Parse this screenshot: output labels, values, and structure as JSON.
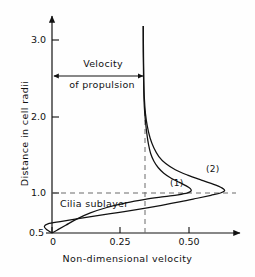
{
  "chart_data": {
    "type": "line",
    "title": "",
    "xlabel": "Non-dimensional velocity",
    "ylabel": "Distance in cell radii",
    "xlim": [
      0,
      0.72
    ],
    "ylim": [
      0.5,
      3.2
    ],
    "xticks": [
      0,
      0.25,
      0.5
    ],
    "xtick_labels": [
      "0",
      "0.25",
      "0.50"
    ],
    "yticks": [
      0.5,
      1.0,
      2.0,
      3.0
    ],
    "ytick_labels": [
      "0.5",
      "1.0",
      "2.0",
      "3.0"
    ],
    "grid": false,
    "legend_position": "inline-annotation",
    "reference_lines": [
      {
        "name": "propulsion-velocity-line",
        "orientation": "vertical",
        "value": 0.33,
        "style": "dashed"
      },
      {
        "name": "cell-radius-line",
        "orientation": "horizontal",
        "value": 1.0,
        "style": "dashed"
      }
    ],
    "annotations": [
      {
        "name": "velocity-of-propulsion",
        "text_line1": "Velocity",
        "text_line2": "of propulsion",
        "arrow": "double-headed",
        "from_x": 0.0,
        "to_x": 0.33,
        "y": 2.62
      },
      {
        "name": "cilia-sublayer",
        "text": "Cilia sublayer",
        "x": 0.04,
        "y": 0.92
      },
      {
        "name": "curve-1-label",
        "text": "(1)",
        "x": 0.41,
        "y": 1.12
      },
      {
        "name": "curve-2-label",
        "text": "(2)",
        "x": 0.56,
        "y": 1.28
      }
    ],
    "series": [
      {
        "name": "(1)",
        "label": "(1)",
        "points": [
          [
            0.0,
            0.5
          ],
          [
            0.02,
            0.54
          ],
          [
            0.05,
            0.6
          ],
          [
            0.09,
            0.68
          ],
          [
            0.14,
            0.76
          ],
          [
            0.2,
            0.83
          ],
          [
            0.27,
            0.89
          ],
          [
            0.34,
            0.935
          ],
          [
            0.41,
            0.97
          ],
          [
            0.46,
            0.995
          ],
          [
            0.495,
            1.02
          ],
          [
            0.508,
            1.045
          ],
          [
            0.505,
            1.075
          ],
          [
            0.49,
            1.11
          ],
          [
            0.465,
            1.155
          ],
          [
            0.435,
            1.21
          ],
          [
            0.408,
            1.275
          ],
          [
            0.388,
            1.345
          ],
          [
            0.372,
            1.43
          ],
          [
            0.36,
            1.53
          ],
          [
            0.352,
            1.65
          ],
          [
            0.346,
            1.79
          ],
          [
            0.341,
            1.95
          ],
          [
            0.337,
            2.13
          ],
          [
            0.335,
            2.33
          ],
          [
            0.334,
            2.56
          ],
          [
            0.333,
            2.85
          ],
          [
            0.333,
            3.18
          ]
        ]
      },
      {
        "name": "(2)",
        "label": "(2)",
        "points": [
          [
            0.0,
            0.5
          ],
          [
            -0.02,
            0.545
          ],
          [
            -0.028,
            0.585
          ],
          [
            -0.015,
            0.618
          ],
          [
            0.03,
            0.648
          ],
          [
            0.09,
            0.683
          ],
          [
            0.16,
            0.722
          ],
          [
            0.24,
            0.765
          ],
          [
            0.32,
            0.81
          ],
          [
            0.4,
            0.858
          ],
          [
            0.47,
            0.905
          ],
          [
            0.53,
            0.95
          ],
          [
            0.58,
            0.988
          ],
          [
            0.615,
            1.018
          ],
          [
            0.63,
            1.048
          ],
          [
            0.62,
            1.085
          ],
          [
            0.59,
            1.13
          ],
          [
            0.545,
            1.185
          ],
          [
            0.495,
            1.25
          ],
          [
            0.45,
            1.32
          ],
          [
            0.415,
            1.4
          ],
          [
            0.39,
            1.49
          ],
          [
            0.372,
            1.6
          ],
          [
            0.358,
            1.73
          ],
          [
            0.348,
            1.88
          ],
          [
            0.341,
            2.05
          ],
          [
            0.337,
            2.25
          ],
          [
            0.335,
            2.48
          ],
          [
            0.334,
            2.78
          ],
          [
            0.333,
            3.18
          ]
        ]
      }
    ]
  },
  "axes": {
    "y_title": "Distance in cell radii",
    "x_title": "Non-dimensional velocity",
    "y_labels": [
      "3.0",
      "2.0",
      "1.0",
      "0.5"
    ],
    "x_labels": [
      "0",
      "0.25",
      "0.50"
    ]
  },
  "annotations": {
    "velocity_line1": "Velocity",
    "velocity_line2": "of propulsion",
    "cilia_sublayer": "Cilia sublayer",
    "curve_1": "(1)",
    "curve_2": "(2)"
  },
  "colors": {
    "background": "#fefefe",
    "ink": "#111111",
    "dashed": "#6b6b6b"
  }
}
